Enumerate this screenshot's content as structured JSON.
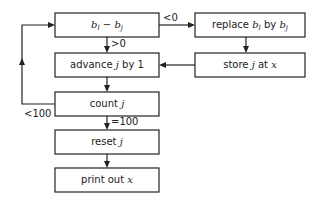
{
  "diagram": {
    "nodes": {
      "compare": {
        "parts": [
          {
            "t": "b",
            "i": true
          },
          {
            "t": "l",
            "sub": true
          },
          {
            "t": " − ",
            "i": false
          },
          {
            "t": "b",
            "i": true
          },
          {
            "t": "j",
            "sub": true
          }
        ]
      },
      "advance": {
        "parts": [
          {
            "t": "advance ",
            "i": false
          },
          {
            "t": "j",
            "i": true
          },
          {
            "t": " by 1",
            "i": false
          }
        ]
      },
      "replace": {
        "parts": [
          {
            "t": "replace ",
            "i": false
          },
          {
            "t": "b",
            "i": true
          },
          {
            "t": "l",
            "sub": true
          },
          {
            "t": " by ",
            "i": false
          },
          {
            "t": "b",
            "i": true
          },
          {
            "t": "j",
            "sub": true
          }
        ]
      },
      "store": {
        "parts": [
          {
            "t": "store ",
            "i": false
          },
          {
            "t": "j",
            "i": true
          },
          {
            "t": " at ",
            "i": false
          },
          {
            "t": "x",
            "i": true
          }
        ]
      },
      "count": {
        "parts": [
          {
            "t": "count ",
            "i": false
          },
          {
            "t": "j",
            "i": true
          }
        ]
      },
      "reset": {
        "parts": [
          {
            "t": "reset ",
            "i": false
          },
          {
            "t": "j",
            "i": true
          }
        ]
      },
      "print": {
        "parts": [
          {
            "t": "print out ",
            "i": false
          },
          {
            "t": "x",
            "i": true
          }
        ]
      }
    },
    "edge_labels": {
      "lt0": "<0",
      "gt0": ">0",
      "lt100": "<100",
      "eq100": "=100"
    }
  }
}
